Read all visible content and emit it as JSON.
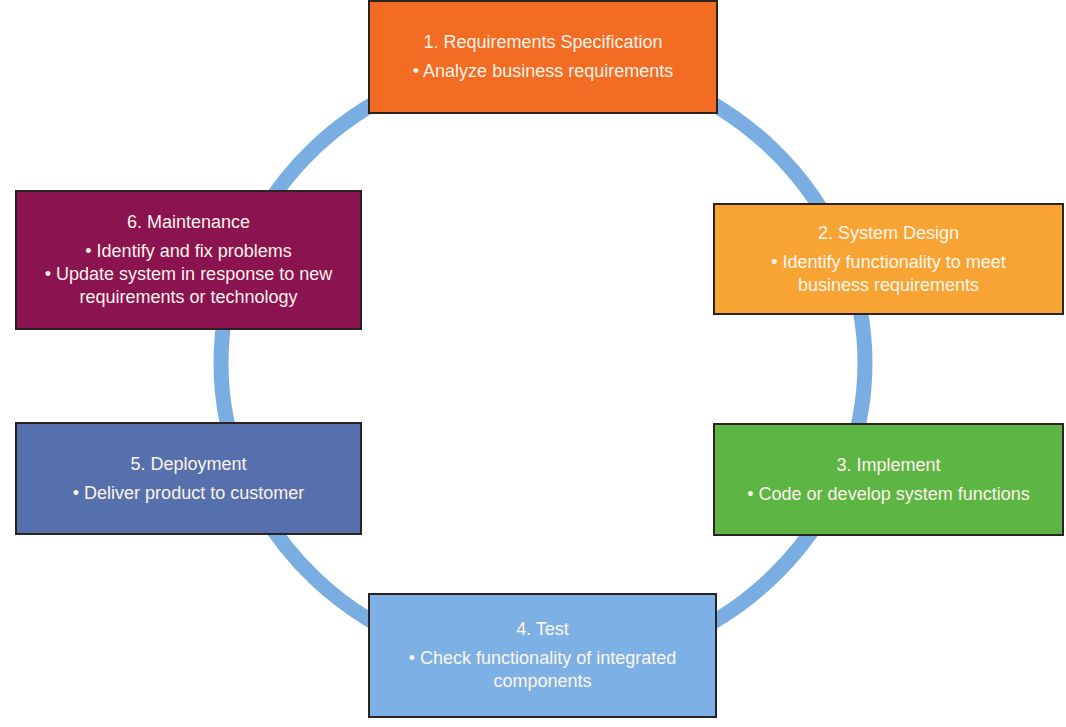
{
  "diagram": {
    "type": "cycle",
    "ring_color": "#7aaee3",
    "steps": [
      {
        "label": "1. Requirements Specification",
        "bullets": [
          "• Analyze business requirements"
        ],
        "color": "#f26c23"
      },
      {
        "label": "2. System Design",
        "bullets": [
          "• Identify functionality to meet business requirements"
        ],
        "color": "#f8a435"
      },
      {
        "label": "3. Implement",
        "bullets": [
          "• Code or develop system functions"
        ],
        "color": "#5db544"
      },
      {
        "label": "4. Test",
        "bullets": [
          "• Check functionality of integrated components"
        ],
        "color": "#7db1e6"
      },
      {
        "label": "5. Deployment",
        "bullets": [
          "• Deliver product to customer"
        ],
        "color": "#5670ad"
      },
      {
        "label": "6. Maintenance",
        "bullets": [
          "• Identify and fix problems",
          "• Update system in response to new requirements or technology"
        ],
        "color": "#8b1350"
      }
    ]
  }
}
